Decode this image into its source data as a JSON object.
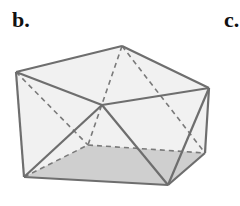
{
  "panels": [
    {
      "label": "b."
    },
    {
      "label": "c."
    }
  ],
  "figure": {
    "colors": {
      "edge": "#6e6e6e",
      "hidden_edge": "#7a7a7a",
      "face_fill": "#ececec",
      "base_fill": "#c8c8c8"
    },
    "vertices": {
      "top_left": [
        16,
        72
      ],
      "top_back": [
        122,
        46
      ],
      "top_right": [
        209,
        88
      ],
      "center": [
        102,
        105
      ],
      "bottom_left": [
        24,
        177
      ],
      "bottom_right": [
        168,
        185
      ],
      "back_right": [
        205,
        153
      ],
      "back_left": [
        88,
        145
      ]
    }
  }
}
